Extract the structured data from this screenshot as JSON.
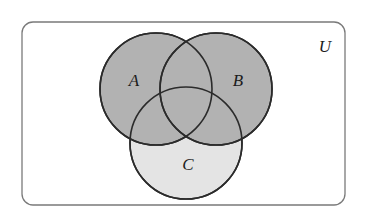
{
  "figure": {
    "kind": "venn-diagram",
    "background_color": "#ffffff"
  },
  "universe": {
    "label": "U",
    "border_color": "#7a7a7a",
    "fill_color": "#ffffff",
    "rect": {
      "x": 22,
      "y": 22,
      "width": 323,
      "height": 183,
      "radius": 11
    },
    "label_position": {
      "x": 325,
      "y": 48
    }
  },
  "sets": [
    {
      "id": "A",
      "label": "A",
      "fill_color": "#b2b2b2",
      "stroke_color": "#2b2b2b",
      "circle": {
        "cx": 156,
        "cy": 89,
        "r": 56
      },
      "label_position": {
        "x": 134,
        "y": 82
      },
      "draw_order": 2
    },
    {
      "id": "B",
      "label": "B",
      "fill_color": "#b2b2b2",
      "stroke_color": "#2b2b2b",
      "circle": {
        "cx": 216,
        "cy": 89,
        "r": 56
      },
      "label_position": {
        "x": 238,
        "y": 82
      },
      "draw_order": 3
    },
    {
      "id": "C",
      "label": "C",
      "fill_color": "#e4e4e4",
      "stroke_color": "#2b2b2b",
      "circle": {
        "cx": 186,
        "cy": 143,
        "r": 56
      },
      "label_position": {
        "x": 188,
        "y": 166
      },
      "draw_order": 1
    }
  ],
  "styles": {
    "circle_stroke_width": 1.6,
    "universe_stroke_width": 1.3
  }
}
